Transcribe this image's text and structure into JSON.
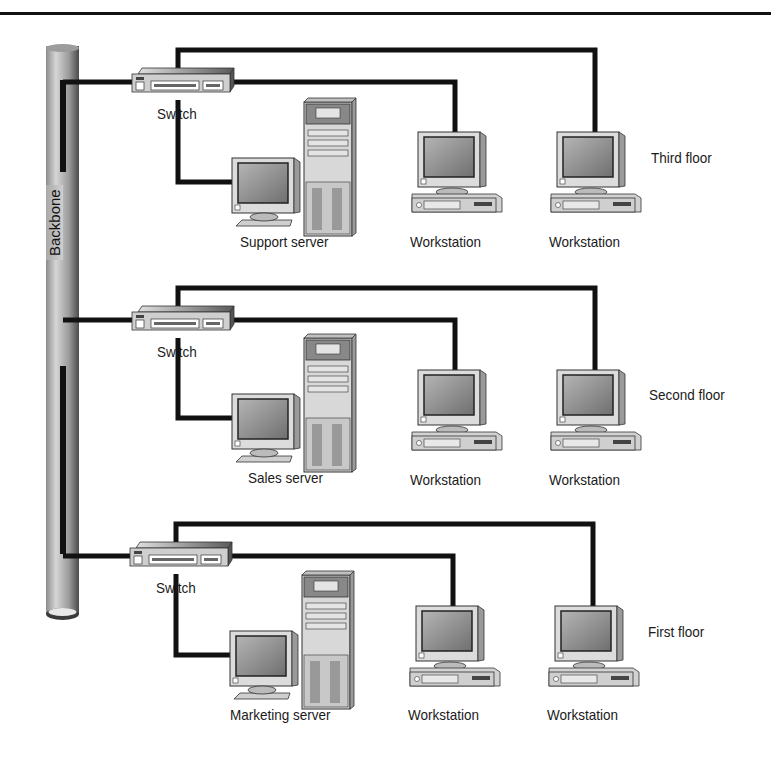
{
  "diagram": {
    "type": "network-topology",
    "backbone": {
      "label": "Backbone"
    },
    "floors": [
      {
        "name": "Third floor",
        "switch": {
          "label": "Switch"
        },
        "server": {
          "label": "Support server"
        },
        "workstations": [
          {
            "label": "Workstation"
          },
          {
            "label": "Workstation"
          }
        ]
      },
      {
        "name": "Second floor",
        "switch": {
          "label": "Switch"
        },
        "server": {
          "label": "Sales server"
        },
        "workstations": [
          {
            "label": "Workstation"
          },
          {
            "label": "Workstation"
          }
        ]
      },
      {
        "name": "First floor",
        "switch": {
          "label": "Switch"
        },
        "server": {
          "label": "Marketing server"
        },
        "workstations": [
          {
            "label": "Workstation"
          },
          {
            "label": "Workstation"
          }
        ]
      }
    ],
    "colors": {
      "cable": "#111111",
      "device_fill": "#d9d9d9",
      "screen": "#8a8a8a",
      "background": "#ffffff"
    }
  }
}
